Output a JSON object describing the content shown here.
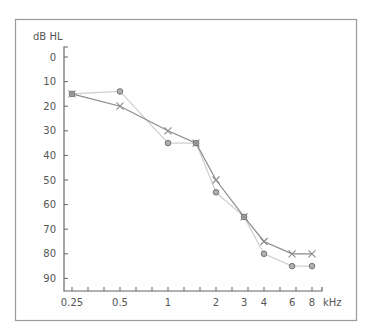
{
  "chart_data": {
    "type": "line",
    "title": "",
    "ylabel": "dB HL",
    "xlabel": "kHz",
    "x_scale": "log",
    "y_inverted": true,
    "ylim": [
      0,
      95
    ],
    "yticks": [
      0,
      10,
      20,
      30,
      40,
      50,
      60,
      70,
      80,
      90
    ],
    "xticks": [
      {
        "value": 0.25,
        "label": "0.25"
      },
      {
        "value": 0.5,
        "label": "0.5"
      },
      {
        "value": 1,
        "label": "1"
      },
      {
        "value": 2,
        "label": "2"
      },
      {
        "value": 3,
        "label": "3"
      },
      {
        "value": 4,
        "label": "4"
      },
      {
        "value": 6,
        "label": "6"
      },
      {
        "value": 8,
        "label": "8"
      }
    ],
    "grid": false,
    "legend": null,
    "series": [
      {
        "name": "circle-series",
        "marker": "circle",
        "color": "#cfcfcf",
        "marker_fill": "#b0b0b0",
        "points": [
          [
            0.25,
            15
          ],
          [
            0.5,
            14
          ],
          [
            1,
            35
          ],
          [
            1.5,
            35
          ],
          [
            2,
            55
          ],
          [
            3,
            65
          ],
          [
            4,
            80
          ],
          [
            6,
            85
          ],
          [
            8,
            85
          ]
        ]
      },
      {
        "name": "cross-series",
        "marker": "x",
        "color": "#8a8a8a",
        "points": [
          [
            0.25,
            15
          ],
          [
            0.5,
            20
          ],
          [
            1,
            30
          ],
          [
            1.5,
            35
          ],
          [
            2,
            50
          ],
          [
            3,
            65
          ],
          [
            4,
            75
          ],
          [
            6,
            80
          ],
          [
            8,
            80
          ]
        ]
      }
    ]
  }
}
